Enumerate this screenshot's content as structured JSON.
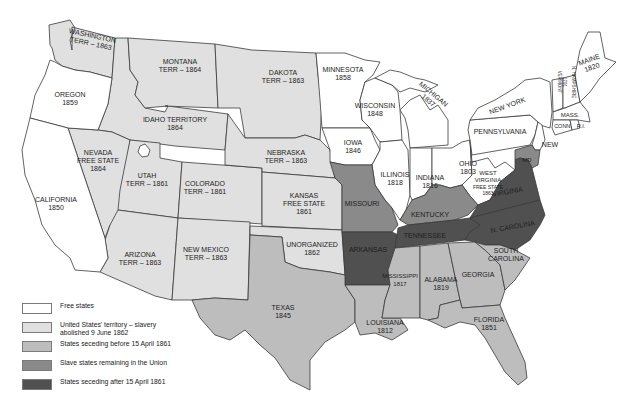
{
  "colors": {
    "free": "#ffffff",
    "territory": "#e0e0e0",
    "seceding_before": "#bdbdbd",
    "slave_union": "#8a8a8a",
    "seceding_after": "#505050",
    "border": "#3a3a3a"
  },
  "legend": {
    "items": [
      {
        "label": "Free states",
        "category": "free"
      },
      {
        "label": "United States' territory – slavery abolished 9 June 1862",
        "category": "territory"
      },
      {
        "label": "States seceding before 15 April 1861",
        "category": "seceding_before"
      },
      {
        "label": "Slave states remaining in the Union",
        "category": "slave_union"
      },
      {
        "label": "States seceding after 15 April 1861",
        "category": "seceding_after"
      }
    ]
  },
  "regions": {
    "washington": {
      "name": "WASHINGTON",
      "sub": "TERR – 1863"
    },
    "oregon": {
      "name": "OREGON",
      "sub": "1859"
    },
    "california": {
      "name": "CALIFORNIA",
      "sub": "1850"
    },
    "nevada": {
      "name": "NEVADA",
      "name2": "FREE STATE",
      "sub": "1864"
    },
    "idaho": {
      "name": "IDAHO TERRITORY",
      "sub": "1864"
    },
    "montana": {
      "name": "MONTANA",
      "sub": "TERR – 1864"
    },
    "utah": {
      "name": "UTAH",
      "sub": "TERR – 1861"
    },
    "arizona": {
      "name": "ARIZONA",
      "sub": "TERR – 1863"
    },
    "colorado": {
      "name": "COLORADO",
      "sub": "TERR – 1861"
    },
    "new_mexico": {
      "name": "NEW MEXICO",
      "sub": "TERR – 1863"
    },
    "dakota": {
      "name": "DAKOTA",
      "sub": "TERR – 1863"
    },
    "nebraska": {
      "name": "NEBRASKA",
      "sub": "TERR – 1863"
    },
    "kansas": {
      "name": "KANSAS",
      "name2": "FREE STATE",
      "sub": "1861"
    },
    "unorganized": {
      "name": "UNORGANIZED",
      "sub": "1862"
    },
    "texas": {
      "name": "TEXAS",
      "sub": "1845"
    },
    "minnesota": {
      "name": "MINNESOTA",
      "sub": "1858"
    },
    "iowa": {
      "name": "IOWA",
      "sub": "1846"
    },
    "missouri": {
      "name": "MISSOURI"
    },
    "arkansas": {
      "name": "ARKANSAS"
    },
    "louisiana": {
      "name": "LOUISIANA",
      "sub": "1812"
    },
    "wisconsin": {
      "name": "WISCONSIN",
      "sub": "1848"
    },
    "illinois": {
      "name": "ILLINOIS",
      "sub": "1818"
    },
    "michigan": {
      "name": "MICHIGAN",
      "sub": "1837"
    },
    "indiana": {
      "name": "INDIANA",
      "sub": "1816"
    },
    "ohio": {
      "name": "OHIO",
      "sub": "1803"
    },
    "kentucky": {
      "name": "KENTUCKY"
    },
    "tennessee": {
      "name": "TENNESSEE"
    },
    "mississippi": {
      "name": "MISSISSIPPI",
      "sub": "1817"
    },
    "alabama": {
      "name": "ALABAMA",
      "sub": "1819"
    },
    "georgia": {
      "name": "GEORGIA"
    },
    "florida": {
      "name": "FLORIDA",
      "sub": "1851"
    },
    "south_carolina": {
      "name": "SOUTH",
      "name2": "CAROLINA"
    },
    "north_carolina": {
      "name": "N. CAROLINA"
    },
    "virginia": {
      "name": "VIRGINIA"
    },
    "west_virginia": {
      "name": "WEST",
      "name2": "VIRGINIA",
      "name3": "FREE STATE",
      "sub": "1863"
    },
    "maryland": {
      "name": "MD"
    },
    "pennsylvania": {
      "name": "PENNSYLVANIA"
    },
    "new_jersey": {
      "name": "NEW",
      "name2": "JERSEY"
    },
    "new_york": {
      "name": "NEW YORK"
    },
    "vermont": {
      "name": "VERMONT",
      "sub": "1791"
    },
    "new_hampshire": {
      "name": "N. HAMPSHIRE"
    },
    "maine": {
      "name": "MAINE",
      "sub": "1820"
    },
    "massachusetts": {
      "name": "MASS."
    },
    "connecticut": {
      "name": "CONN."
    },
    "rhode_island": {
      "name": "R.I."
    }
  }
}
